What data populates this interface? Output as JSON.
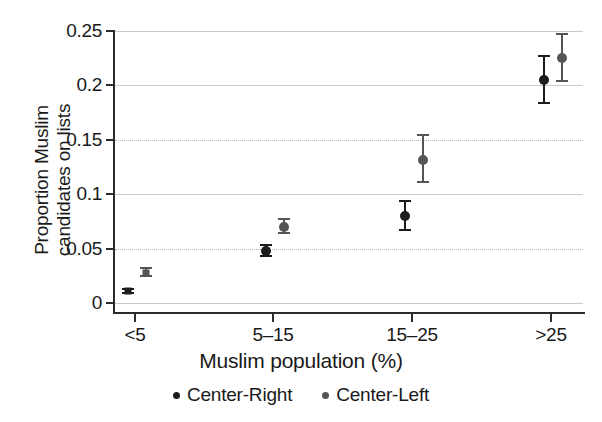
{
  "chart_data": {
    "type": "scatter",
    "title": "",
    "xlabel": "Muslim population (%)",
    "ylabel_line1": "Proportion Muslim",
    "ylabel_line2": "candidates on lists",
    "categories": [
      "<5",
      "5–15",
      "15–25",
      ">25"
    ],
    "ylim": [
      0,
      0.25
    ],
    "yticks": [
      0,
      0.05,
      0.1,
      0.15,
      0.2,
      0.25
    ],
    "ytick_labels": [
      "0",
      "0.05",
      "0.1",
      "0.15",
      "0.2",
      "0.25"
    ],
    "grid": true,
    "legend_position": "bottom-center",
    "series": [
      {
        "name": "Center-Right",
        "color": "#1c1c1c",
        "marker": "circle",
        "values": [
          0.011,
          0.048,
          0.08,
          0.205
        ],
        "ci_low": [
          0.008,
          0.042,
          0.066,
          0.183
        ],
        "ci_high": [
          0.014,
          0.054,
          0.095,
          0.228
        ]
      },
      {
        "name": "Center-Left",
        "color": "#555555",
        "marker": "circle",
        "values": [
          0.028,
          0.07,
          0.131,
          0.225
        ],
        "ci_low": [
          0.024,
          0.063,
          0.11,
          0.203
        ],
        "ci_high": [
          0.033,
          0.078,
          0.155,
          0.248
        ]
      }
    ]
  },
  "legend": {
    "items": [
      {
        "label": "Center-Right",
        "color": "#1c1c1c"
      },
      {
        "label": "Center-Left",
        "color": "#555555"
      }
    ]
  },
  "axes": {
    "x_title": "Muslim population (%)",
    "y_title_line1": "Proportion Muslim",
    "y_title_line2": "candidates on lists"
  }
}
